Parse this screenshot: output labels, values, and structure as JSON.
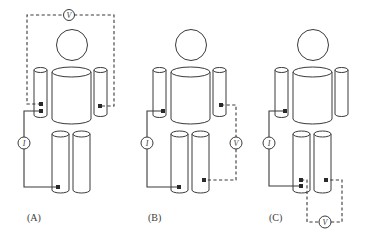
{
  "figure": {
    "panels": [
      {
        "id": "A",
        "label": "(A)",
        "current_meter": "I",
        "voltage_meter": "V",
        "description": "Current injected between left arm and left leg; voltage measured between left arm and right arm"
      },
      {
        "id": "B",
        "label": "(B)",
        "current_meter": "I",
        "voltage_meter": "V",
        "description": "Current injected between left arm and left leg; voltage measured between right arm and right leg"
      },
      {
        "id": "C",
        "label": "(C)",
        "current_meter": "I",
        "voltage_meter": "V",
        "description": "Current injected between left arm and left leg; voltage measured between left leg and right leg"
      }
    ],
    "colors": {
      "line": "#3a3a3a",
      "electrode": "#2a2a2a",
      "background": "#ffffff"
    }
  }
}
